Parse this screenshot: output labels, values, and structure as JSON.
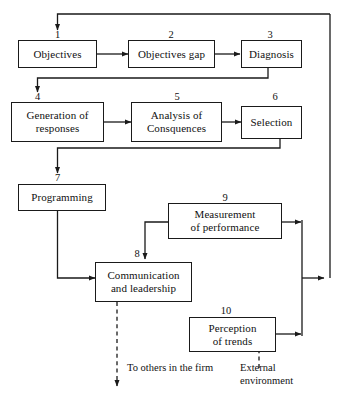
{
  "diagram": {
    "colors": {
      "stroke": "#1a1a1a",
      "background": "#ffffff",
      "text": "#111111"
    },
    "nodes": [
      {
        "number": "1",
        "label": "Objectives"
      },
      {
        "number": "2",
        "label": "Objectives gap"
      },
      {
        "number": "3",
        "label": "Diagnosis"
      },
      {
        "number": "4",
        "label": "Generation of\nresponses"
      },
      {
        "number": "5",
        "label": "Analysis of\nConsquences"
      },
      {
        "number": "6",
        "label": "Selection"
      },
      {
        "number": "7",
        "label": "Programming"
      },
      {
        "number": "8",
        "label": "Communication\nand leadership"
      },
      {
        "number": "9",
        "label": "Measurement\nof performance"
      },
      {
        "number": "10",
        "label": "Perception\nof trends"
      }
    ],
    "annotations": [
      {
        "name": "to-others-in-the-firm",
        "text": "To others in the firm"
      },
      {
        "name": "external-environment",
        "text": "External\nenvironment"
      }
    ]
  }
}
